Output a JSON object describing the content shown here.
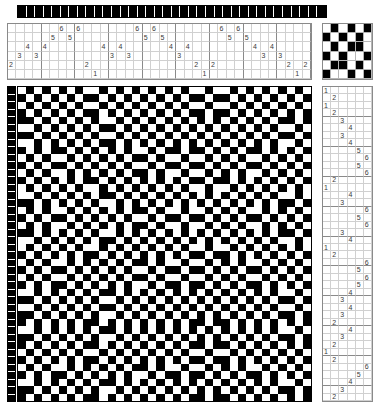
{
  "document": {
    "kind": "weaving-draft",
    "title": "Weaving Draft",
    "shafts": 6,
    "treadles": 6,
    "warp_ends": 36,
    "weft_picks": 42,
    "colors": {
      "warp_dark": "#000000",
      "warp_light": "#ffffff",
      "cloth_dark": "#000000",
      "cloth_light": "#ffffff",
      "grid_line": "#d0d0d0",
      "grid_major": "#8a8a8a",
      "number_text": "#555555"
    }
  },
  "warp_color_bar": {
    "label": "warp colour sequence",
    "sequence": [
      "dark",
      "dark",
      "dark",
      "dark",
      "dark",
      "dark",
      "dark",
      "dark",
      "dark",
      "dark",
      "dark",
      "dark",
      "dark",
      "dark",
      "dark",
      "dark",
      "dark",
      "dark",
      "dark",
      "dark",
      "dark",
      "dark",
      "dark",
      "dark",
      "dark",
      "dark",
      "dark",
      "dark",
      "dark",
      "dark",
      "dark",
      "dark",
      "dark",
      "dark",
      "dark",
      "dark"
    ]
  },
  "threading": {
    "label": "threading draft",
    "shaft_rows": [
      6,
      5,
      4,
      3,
      2,
      1
    ],
    "shaft_row_labels": [
      "6",
      "5",
      "4",
      "3",
      "2",
      "1"
    ],
    "ends": [
      2,
      3,
      4,
      3,
      4,
      5,
      6,
      5,
      6,
      2,
      1,
      4,
      3,
      4,
      3,
      6,
      5,
      6,
      5,
      4,
      3,
      4,
      2,
      1,
      2,
      6,
      5,
      6,
      5,
      4,
      3,
      4,
      3,
      2,
      1,
      2
    ],
    "end_labels": [
      "2",
      "3",
      "4",
      "3",
      "4",
      "5",
      "6",
      "5",
      "6",
      "2",
      "1",
      "4",
      "3",
      "4",
      "3",
      "6",
      "5",
      "6",
      "5",
      "4",
      "3",
      "4",
      "2",
      "1",
      "2",
      "6",
      "5",
      "6",
      "5",
      "4",
      "3",
      "4",
      "3",
      "2",
      "1",
      "2"
    ],
    "major_every": 4
  },
  "tieup": {
    "label": "tie-up",
    "rows": [
      [
        0,
        1,
        0,
        1,
        0,
        1
      ],
      [
        1,
        0,
        1,
        0,
        1,
        0
      ],
      [
        0,
        1,
        0,
        1,
        1,
        0
      ],
      [
        1,
        0,
        1,
        0,
        0,
        1
      ],
      [
        0,
        1,
        1,
        0,
        1,
        0
      ],
      [
        1,
        0,
        0,
        1,
        0,
        1
      ]
    ]
  },
  "treadling": {
    "label": "treadling sequence",
    "treadle_columns": [
      "1",
      "2",
      "3",
      "4",
      "5",
      "6"
    ],
    "picks": [
      1,
      2,
      1,
      2,
      3,
      4,
      3,
      4,
      5,
      6,
      5,
      6,
      2,
      1,
      4,
      3,
      6,
      5,
      6,
      3,
      4,
      1,
      2,
      6,
      5,
      6,
      5,
      4,
      3,
      4,
      3,
      2,
      4,
      3,
      2,
      1,
      2,
      6,
      5,
      4,
      3,
      2
    ],
    "pick_labels": [
      "1",
      "2",
      "1",
      "2",
      "3",
      "4",
      "3",
      "4",
      "5",
      "6",
      "5",
      "6",
      "2",
      "1",
      "4",
      "3",
      "6",
      "5",
      "6",
      "3",
      "4",
      "1",
      "2",
      "6",
      "5",
      "6",
      "5",
      "4",
      "3",
      "4",
      "3",
      "2",
      "4",
      "3",
      "2",
      "1",
      "2",
      "6",
      "5",
      "4",
      "3",
      "2"
    ],
    "major_every": 4
  },
  "weft_color_bar": {
    "label": "weft colour sequence",
    "sequence": [
      "dark",
      "dark",
      "dark",
      "dark",
      "dark",
      "dark",
      "dark",
      "dark",
      "dark",
      "dark",
      "dark",
      "dark",
      "dark",
      "dark",
      "dark",
      "dark",
      "dark",
      "dark",
      "dark",
      "dark",
      "dark",
      "dark",
      "dark",
      "dark",
      "dark",
      "dark",
      "dark",
      "dark",
      "dark",
      "dark",
      "dark",
      "dark",
      "dark",
      "dark",
      "dark",
      "dark",
      "dark",
      "dark",
      "dark",
      "dark",
      "dark",
      "dark"
    ]
  },
  "drawdown": {
    "label": "fabric drawdown",
    "columns": 36,
    "rows": 42,
    "note": "computed from threading x tieup x treadling"
  }
}
